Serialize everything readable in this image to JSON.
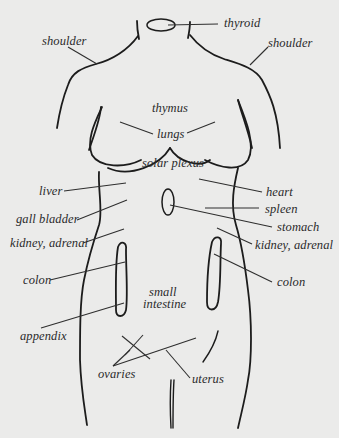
{
  "diagram": {
    "labels": {
      "thyroid": "thyroid",
      "shoulder_left": "shoulder",
      "shoulder_right": "shoulder",
      "thymus": "thymus",
      "lungs": "lungs",
      "solar_plexus": "solar plexus",
      "liver": "liver",
      "heart": "heart",
      "gall_bladder": "gall bladder",
      "spleen": "spleen",
      "stomach": "stomach",
      "kidney_adrenal_left": "kidney, adrenal",
      "kidney_adrenal_right": "kidney, adrenal",
      "colon_left": "colon",
      "colon_right": "colon",
      "small_intestine_line1": "small",
      "small_intestine_line2": "intestine",
      "appendix": "appendix",
      "ovaries": "ovaries",
      "uterus": "uterus"
    },
    "colors": {
      "background": "#ebebea",
      "line": "#1c1c1c",
      "text": "#2a2a2a"
    }
  }
}
